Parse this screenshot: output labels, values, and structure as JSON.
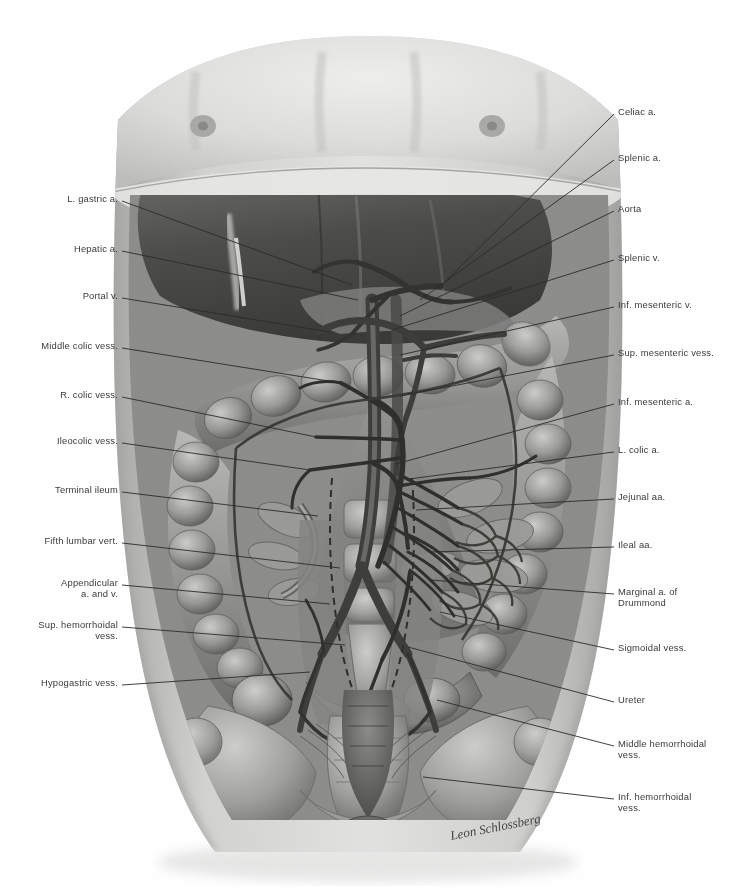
{
  "plate": {
    "title": "Abdominal viscera — arterial and venous supply of the intestines",
    "signature": "Leon Schlossberg",
    "background_color": "#ffffff",
    "ink_color": "#3a3a3a",
    "leader_color": "#2b2b2b",
    "skin_tone": "#d8d8d6",
    "liver_tone": "#4a4a4a",
    "bowel_tone": "#8e8e8c"
  },
  "labels_left": [
    {
      "id": "l-gastric-a",
      "text": "L. gastric a.",
      "line2": "",
      "x": 118,
      "y": 199,
      "lx": 122,
      "ly": 201,
      "tx": 352,
      "ty": 285
    },
    {
      "id": "hepatic-a",
      "text": "Hepatic a.",
      "line2": "",
      "x": 118,
      "y": 249,
      "lx": 122,
      "ly": 251,
      "tx": 358,
      "ty": 300
    },
    {
      "id": "portal-v",
      "text": "Portal v.",
      "line2": "",
      "x": 118,
      "y": 296,
      "lx": 122,
      "ly": 298,
      "tx": 330,
      "ty": 332
    },
    {
      "id": "middle-colic-vess",
      "text": "Middle colic vess.",
      "line2": "",
      "x": 118,
      "y": 346,
      "lx": 122,
      "ly": 348,
      "tx": 341,
      "ty": 383
    },
    {
      "id": "r-colic-vess",
      "text": "R. colic vess.",
      "line2": "",
      "x": 118,
      "y": 395,
      "lx": 122,
      "ly": 397,
      "tx": 316,
      "ty": 437
    },
    {
      "id": "ileocolic-vess",
      "text": "Ileocolic vess.",
      "line2": "",
      "x": 118,
      "y": 441,
      "lx": 122,
      "ly": 443,
      "tx": 310,
      "ty": 470
    },
    {
      "id": "terminal-ileum",
      "text": "Terminal ileum",
      "line2": "",
      "x": 118,
      "y": 490,
      "lx": 122,
      "ly": 492,
      "tx": 318,
      "ty": 516
    },
    {
      "id": "fifth-lumbar-vert",
      "text": "Fifth lumbar vert.",
      "line2": "",
      "x": 118,
      "y": 541,
      "lx": 122,
      "ly": 543,
      "tx": 340,
      "ty": 568
    },
    {
      "id": "appendicular-a-v",
      "text": "Appendicular",
      "line2": "a. and v.",
      "x": 118,
      "y": 583,
      "lx": 122,
      "ly": 585,
      "tx": 330,
      "ty": 604
    },
    {
      "id": "sup-hemorrhoidal",
      "text": "Sup. hemorrhoidal",
      "line2": "vess.",
      "x": 118,
      "y": 625,
      "lx": 122,
      "ly": 627,
      "tx": 345,
      "ty": 645
    },
    {
      "id": "hypogastric-vess",
      "text": "Hypogastric vess.",
      "line2": "",
      "x": 118,
      "y": 683,
      "lx": 122,
      "ly": 685,
      "tx": 310,
      "ty": 672
    }
  ],
  "labels_right": [
    {
      "id": "celiac-a",
      "text": "Celiac a.",
      "line2": "",
      "x": 618,
      "y": 112,
      "lx": 614,
      "ly": 114,
      "tx": 441,
      "ty": 286
    },
    {
      "id": "splenic-a",
      "text": "Splenic a.",
      "line2": "",
      "x": 618,
      "y": 158,
      "lx": 614,
      "ly": 160,
      "tx": 420,
      "ty": 300
    },
    {
      "id": "aorta",
      "text": "Aorta",
      "line2": "",
      "x": 618,
      "y": 209,
      "lx": 614,
      "ly": 211,
      "tx": 400,
      "ty": 316
    },
    {
      "id": "splenic-v",
      "text": "Splenic v.",
      "line2": "",
      "x": 618,
      "y": 258,
      "lx": 614,
      "ly": 260,
      "tx": 392,
      "ty": 330
    },
    {
      "id": "inf-mesenteric-v",
      "text": "Inf. mesenteric v.",
      "line2": "",
      "x": 618,
      "y": 305,
      "lx": 614,
      "ly": 307,
      "tx": 400,
      "ty": 355
    },
    {
      "id": "sup-mesenteric-vess",
      "text": "Sup. mesenteric vess.",
      "line2": "",
      "x": 618,
      "y": 353,
      "lx": 614,
      "ly": 355,
      "tx": 400,
      "ty": 396
    },
    {
      "id": "inf-mesenteric-a",
      "text": "Inf. mesenteric a.",
      "line2": "",
      "x": 618,
      "y": 402,
      "lx": 614,
      "ly": 404,
      "tx": 396,
      "ty": 464
    },
    {
      "id": "l-colic-a",
      "text": "L. colic a.",
      "line2": "",
      "x": 618,
      "y": 450,
      "lx": 614,
      "ly": 452,
      "tx": 409,
      "ty": 479
    },
    {
      "id": "jejunal-aa",
      "text": "Jejunal aa.",
      "line2": "",
      "x": 618,
      "y": 497,
      "lx": 614,
      "ly": 499,
      "tx": 416,
      "ty": 510
    },
    {
      "id": "ileal-aa",
      "text": "Ileal aa.",
      "line2": "",
      "x": 618,
      "y": 545,
      "lx": 614,
      "ly": 547,
      "tx": 430,
      "ty": 552
    },
    {
      "id": "marginal-a-drummond",
      "text": "Marginal a. of",
      "line2": "Drummond",
      "x": 618,
      "y": 592,
      "lx": 614,
      "ly": 594,
      "tx": 430,
      "ty": 580
    },
    {
      "id": "sigmoidal-vess",
      "text": "Sigmoidal vess.",
      "line2": "",
      "x": 618,
      "y": 648,
      "lx": 614,
      "ly": 650,
      "tx": 440,
      "ty": 612
    },
    {
      "id": "ureter",
      "text": "Ureter",
      "line2": "",
      "x": 618,
      "y": 700,
      "lx": 614,
      "ly": 702,
      "tx": 408,
      "ty": 647
    },
    {
      "id": "middle-hemorrhoidal",
      "text": "Middle hemorrhoidal",
      "line2": "vess.",
      "x": 618,
      "y": 744,
      "lx": 614,
      "ly": 746,
      "tx": 437,
      "ty": 700
    },
    {
      "id": "inf-hemorrhoidal",
      "text": "Inf. hemorrhoidal",
      "line2": "vess.",
      "x": 618,
      "y": 797,
      "lx": 614,
      "ly": 799,
      "tx": 423,
      "ty": 777
    }
  ]
}
